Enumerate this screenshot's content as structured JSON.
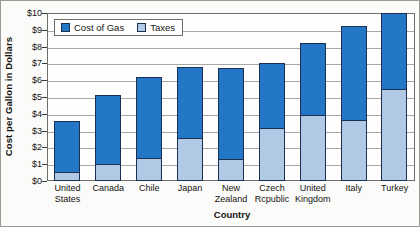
{
  "chart_data": {
    "type": "bar",
    "subtype": "stacked-bar",
    "title": "",
    "xlabel": "Country",
    "ylabel": "Cost per Gallon in Dollars",
    "ylim": [
      0,
      10
    ],
    "ytick_step": 1,
    "ytick_labels": [
      "$10",
      "$9",
      "$8",
      "$7",
      "$6",
      "$5",
      "$4",
      "$3",
      "$2",
      "$1",
      "$0"
    ],
    "grid": true,
    "legend_position": "top-left-inside",
    "categories": [
      "United States",
      "Canada",
      "Chile",
      "Japan",
      "New Zealand",
      "Czech Rcpublic",
      "United Kingdom",
      "Italy",
      "Turkey"
    ],
    "category_lines": [
      [
        "United",
        "States"
      ],
      [
        "Canada",
        ""
      ],
      [
        "Chile",
        ""
      ],
      [
        "Japan",
        ""
      ],
      [
        "New",
        "Zealand"
      ],
      [
        "Czech",
        "Rcpublic"
      ],
      [
        "United",
        "Kingdom"
      ],
      [
        "Italy",
        ""
      ],
      [
        "Turkey",
        ""
      ]
    ],
    "series": [
      {
        "name": "Taxes",
        "color": "#b2c9e6",
        "values": [
          0.5,
          0.95,
          1.35,
          2.55,
          1.25,
          3.15,
          3.9,
          3.6,
          5.5
        ]
      },
      {
        "name": "Cost of Gas",
        "color": "#2476c6",
        "values": [
          3.1,
          4.15,
          4.85,
          4.25,
          5.5,
          3.85,
          4.3,
          5.6,
          4.5
        ]
      }
    ],
    "totals": [
      3.6,
      5.1,
      6.2,
      6.8,
      6.75,
      7.0,
      8.2,
      9.2,
      10.0
    ]
  },
  "legend": {
    "entries": [
      {
        "label": "Cost of Gas",
        "color": "#2476c6"
      },
      {
        "label": "Taxes",
        "color": "#b2c9e6"
      }
    ]
  }
}
